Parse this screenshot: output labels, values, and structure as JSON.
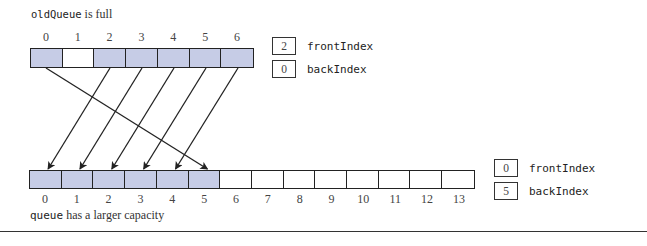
{
  "old_queue": {
    "caption_code": "oldQueue",
    "caption_text": " is full",
    "capacity": 7,
    "indices": [
      "0",
      "1",
      "2",
      "3",
      "4",
      "5",
      "6"
    ],
    "filled": [
      true,
      false,
      true,
      true,
      true,
      true,
      true
    ],
    "front_index": {
      "value": "2",
      "label": "frontIndex"
    },
    "back_index": {
      "value": "0",
      "label": "backIndex"
    }
  },
  "new_queue": {
    "caption_code": "queue",
    "caption_text": " has a larger capacity",
    "capacity": 14,
    "indices": [
      "0",
      "1",
      "2",
      "3",
      "4",
      "5",
      "6",
      "7",
      "8",
      "9",
      "10",
      "11",
      "12",
      "13"
    ],
    "filled": [
      true,
      true,
      true,
      true,
      true,
      true,
      false,
      false,
      false,
      false,
      false,
      false,
      false,
      false
    ],
    "front_index": {
      "value": "0",
      "label": "frontIndex"
    },
    "back_index": {
      "value": "5",
      "label": "backIndex"
    }
  },
  "copy_mapping": [
    {
      "from": 2,
      "to": 0
    },
    {
      "from": 3,
      "to": 1
    },
    {
      "from": 4,
      "to": 2
    },
    {
      "from": 5,
      "to": 3
    },
    {
      "from": 6,
      "to": 4
    },
    {
      "from": 0,
      "to": 5
    }
  ],
  "colors": {
    "filled_cell": "#c6cce6",
    "stroke": "#222222"
  }
}
